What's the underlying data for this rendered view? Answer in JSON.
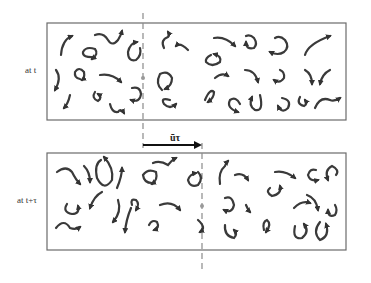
{
  "diagram": {
    "panels": [
      {
        "label": "at t",
        "box": {
          "x": 47,
          "y": 23,
          "w": 299,
          "h": 97
        }
      },
      {
        "label": "at t+τ",
        "box": {
          "x": 47,
          "y": 153,
          "w": 299,
          "h": 97
        }
      }
    ],
    "advection_arrow": {
      "label": "ūτ",
      "x1": 143,
      "x2": 202,
      "y": 145
    },
    "reference_lines": [
      {
        "x": 143,
        "y1": 13,
        "y2": 148
      },
      {
        "x": 202,
        "y1": 143,
        "y2": 272
      }
    ],
    "colors": {
      "box_stroke": "#6b6b6b",
      "eddy_stroke": "#3a3a3a",
      "dashed_line": "#8a8a8a",
      "arrow": "#111111"
    }
  }
}
